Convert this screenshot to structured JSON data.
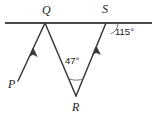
{
  "figure": {
    "type": "geometry-diagram",
    "background_color": "#ffffff",
    "stroke_color": "#3a3a3a",
    "text_color": "#1a1a1a"
  },
  "labels": {
    "point_q": "Q",
    "point_s": "S",
    "point_p": "P",
    "point_r": "R",
    "angle_at_r": "47°",
    "angle_at_s": "115°"
  },
  "geometry": {
    "line": {
      "name": "horizontal-transversal-line",
      "x1": 5,
      "y1": 23,
      "x2": 152,
      "y2": 23
    },
    "points": {
      "Q": {
        "x": 45,
        "y": 23
      },
      "S": {
        "x": 106,
        "y": 23
      },
      "R": {
        "x": 76,
        "y": 96
      },
      "P": {
        "x": 18,
        "y": 81
      }
    },
    "segments": [
      {
        "name": "ray-P-to-Q",
        "x1": 18,
        "y1": 81,
        "x2": 45,
        "y2": 23,
        "arrow_at": {
          "x": 33,
          "y": 49
        }
      },
      {
        "name": "segment-Q-to-R",
        "x1": 45,
        "y1": 23,
        "x2": 76,
        "y2": 96
      },
      {
        "name": "ray-R-to-S",
        "x1": 76,
        "y1": 96,
        "x2": 106,
        "y2": 23,
        "arrow_at": {
          "x": 96,
          "y": 47
        }
      }
    ],
    "arcs": [
      {
        "name": "angle-arc-at-R",
        "value": "47°"
      },
      {
        "name": "angle-arc-at-S",
        "value": "115°"
      }
    ]
  },
  "measures": {
    "angle_QRS_degrees": 47,
    "angle_at_S_degrees": 115
  }
}
